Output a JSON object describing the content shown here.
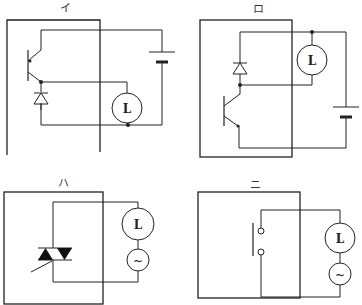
{
  "diagrams": [
    {
      "id": "i",
      "label": "イ",
      "components": [
        "npn-transistor",
        "diode",
        "lamp",
        "dc-battery"
      ],
      "load_label": "L"
    },
    {
      "id": "ro",
      "label": "ロ",
      "components": [
        "npn-transistor",
        "diode",
        "lamp",
        "dc-battery"
      ],
      "load_label": "L"
    },
    {
      "id": "ha",
      "label": "ハ",
      "components": [
        "triac",
        "lamp",
        "ac-source"
      ],
      "load_label": "L",
      "source_label": "~"
    },
    {
      "id": "ni",
      "label": "ニ",
      "components": [
        "switch-contact",
        "lamp",
        "ac-source"
      ],
      "load_label": "L",
      "source_label": "~"
    }
  ],
  "colors": {
    "line": "#222222",
    "background": "#ffffff"
  }
}
